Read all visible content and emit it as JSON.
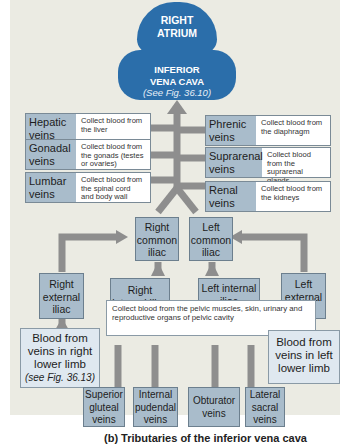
{
  "top": {
    "atrium": [
      "RIGHT",
      "ATRIUM"
    ],
    "ivc": {
      "line1": "INFERIOR",
      "line2": "VENA CAVA",
      "ref": "(See Fig. 36.10)"
    }
  },
  "left_tributaries": [
    {
      "name": "Hepatic veins",
      "desc": "Collect blood from the liver"
    },
    {
      "name": "Gonadal veins",
      "desc": "Collect blood from the gonads (testes or ovaries)"
    },
    {
      "name": "Lumbar veins",
      "desc": "Collect blood from the spinal cord and body wall"
    }
  ],
  "right_tributaries": [
    {
      "name": "Phrenic veins",
      "desc": "Collect blood from the diaphragm"
    },
    {
      "name": "Suprarenal veins",
      "desc": "Collect blood from the suprarenal glands"
    },
    {
      "name": "Renal veins",
      "desc": "Collect blood from the kidneys"
    }
  ],
  "iliac": {
    "right_common": "Right common iliac",
    "left_common": "Left common iliac",
    "right_external": "Right external iliac",
    "left_external": "Left external iliac",
    "right_internal": "Right internal iliac",
    "left_internal": "Left internal iliac",
    "pelvic_desc": "Collect blood from the pelvic muscles, skin, urinary and reproductive organs of pelvic cavity"
  },
  "limbs": {
    "right": {
      "text": "Blood from veins in right lower limb",
      "ref": "(see Fig. 36.13)"
    },
    "left": {
      "text": "Blood from veins in left lower limb"
    }
  },
  "pelvic_veins": [
    "Superior gluteal veins",
    "Internal pudendal veins",
    "Obturator veins",
    "Lateral sacral veins"
  ],
  "caption": "(b) Tributaries of the inferior vena cava",
  "colors": {
    "ivc_blue": "#2b6eaa",
    "box_blue_gray": "#a9bccb",
    "pale_blue": "#dfe8f0",
    "arrow_gray": "#8e8e8e",
    "panel": "#ebebe3"
  }
}
